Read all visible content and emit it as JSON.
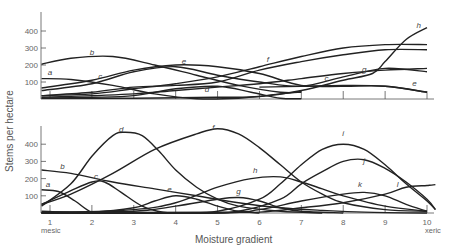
{
  "chart_data": [
    {
      "type": "line",
      "panel": "top",
      "title": "",
      "xlabel": "Moisture gradient",
      "ylabel": "Stems per hectare",
      "xlim": [
        0.8,
        10.3
      ],
      "ylim": [
        0,
        500
      ],
      "yticks": [
        100,
        200,
        300,
        400
      ],
      "xticks": [
        1,
        2,
        3,
        4,
        5,
        6,
        7,
        8,
        9,
        10
      ],
      "xtick_labels_shown": false,
      "series": [
        {
          "name": "a",
          "label_at": [
            1.0,
            140
          ],
          "points": [
            [
              0.8,
              120
            ],
            [
              1.5,
              115
            ],
            [
              2.5,
              80
            ],
            [
              3.5,
              30
            ],
            [
              4.5,
              2
            ],
            [
              5.5,
              5
            ],
            [
              6.5,
              30
            ],
            [
              7.0,
              45
            ]
          ]
        },
        {
          "name": "b",
          "label_at": [
            2.0,
            260
          ],
          "points": [
            [
              0.8,
              205
            ],
            [
              1.5,
              240
            ],
            [
              2.5,
              250
            ],
            [
              3.5,
              200
            ],
            [
              4.5,
              140
            ],
            [
              5.5,
              80
            ],
            [
              6.5,
              40
            ],
            [
              7.0,
              40
            ]
          ]
        },
        {
          "name": "c",
          "label_at": [
            2.2,
            115
          ],
          "points": [
            [
              0.8,
              50
            ],
            [
              2.0,
              90
            ],
            [
              3.0,
              160
            ],
            [
              4.0,
              190
            ],
            [
              5.0,
              140
            ],
            [
              6.0,
              100
            ],
            [
              7.0,
              75
            ],
            [
              8.0,
              130
            ],
            [
              9.0,
              180
            ],
            [
              10.0,
              160
            ]
          ]
        },
        {
          "name": "c",
          "label_at": [
            7.6,
            105
          ],
          "points": [
            [
              0.8,
              20
            ],
            [
              2.0,
              40
            ],
            [
              3.0,
              70
            ],
            [
              4.0,
              80
            ],
            [
              5.0,
              100
            ],
            [
              6.0,
              170
            ],
            [
              7.0,
              220
            ],
            [
              8.0,
              260
            ],
            [
              9.0,
              290
            ],
            [
              10.0,
              290
            ]
          ]
        },
        {
          "name": "d",
          "label_at": [
            4.75,
            40
          ],
          "points": [
            [
              0.8,
              5
            ],
            [
              2.0,
              10
            ],
            [
              3.0,
              20
            ],
            [
              4.0,
              60
            ],
            [
              5.0,
              75
            ],
            [
              5.8,
              40
            ],
            [
              6.5,
              5
            ],
            [
              7.0,
              2
            ]
          ]
        },
        {
          "name": "e",
          "label_at": [
            4.2,
            205
          ],
          "points": [
            [
              0.8,
              65
            ],
            [
              2.0,
              110
            ],
            [
              3.0,
              170
            ],
            [
              4.0,
              200
            ],
            [
              5.0,
              190
            ],
            [
              6.0,
              150
            ],
            [
              7.0,
              80
            ],
            [
              8.0,
              75
            ],
            [
              9.0,
              75
            ],
            [
              10.0,
              40
            ]
          ]
        },
        {
          "name": "e",
          "label_at": [
            9.7,
            75
          ],
          "points": [
            [
              6.0,
              70
            ],
            [
              7.0,
              75
            ],
            [
              8.0,
              80
            ],
            [
              9.0,
              75
            ],
            [
              10.0,
              40
            ]
          ]
        },
        {
          "name": "f",
          "label_at": [
            6.2,
            220
          ],
          "points": [
            [
              0.8,
              20
            ],
            [
              2.0,
              30
            ],
            [
              3.0,
              60
            ],
            [
              4.0,
              90
            ],
            [
              5.0,
              130
            ],
            [
              6.0,
              190
            ],
            [
              7.0,
              250
            ],
            [
              8.0,
              300
            ],
            [
              9.0,
              320
            ],
            [
              10.0,
              320
            ]
          ]
        },
        {
          "name": "g",
          "label_at": [
            8.5,
            160
          ],
          "points": [
            [
              0.8,
              10
            ],
            [
              2.0,
              20
            ],
            [
              3.0,
              30
            ],
            [
              4.0,
              50
            ],
            [
              5.0,
              70
            ],
            [
              6.0,
              90
            ],
            [
              7.0,
              120
            ],
            [
              8.0,
              150
            ],
            [
              9.0,
              170
            ],
            [
              10.0,
              180
            ]
          ]
        },
        {
          "name": "h",
          "label_at": [
            9.8,
            420
          ],
          "points": [
            [
              0.8,
              5
            ],
            [
              3.0,
              5
            ],
            [
              5.0,
              10
            ],
            [
              6.0,
              15
            ],
            [
              7.0,
              50
            ],
            [
              8.0,
              110
            ],
            [
              8.7,
              150
            ],
            [
              9.0,
              220
            ],
            [
              9.5,
              350
            ],
            [
              10.0,
              420
            ]
          ]
        }
      ]
    },
    {
      "type": "line",
      "panel": "bottom",
      "title": "",
      "xlabel": "Moisture gradient",
      "ylabel": "Stems per hectare",
      "xlim": [
        0.8,
        10.3
      ],
      "ylim": [
        0,
        500
      ],
      "yticks": [
        100,
        200,
        300,
        400
      ],
      "xticks": [
        1,
        2,
        3,
        4,
        5,
        6,
        7,
        8,
        9,
        10
      ],
      "xtick_labels": [
        "1",
        "2",
        "3",
        "4",
        "5",
        "6",
        "7",
        "8",
        "9",
        "10"
      ],
      "x_end_labels": {
        "left": "mesic",
        "right": "xeric"
      },
      "series": [
        {
          "name": "a",
          "label_at": [
            0.95,
            150
          ],
          "points": [
            [
              0.8,
              135
            ],
            [
              1.2,
              125
            ],
            [
              1.6,
              70
            ],
            [
              2.0,
              5
            ],
            [
              2.5,
              0
            ]
          ]
        },
        {
          "name": "b",
          "label_at": [
            1.3,
            255
          ],
          "points": [
            [
              0.8,
              250
            ],
            [
              1.5,
              230
            ],
            [
              2.5,
              180
            ],
            [
              3.5,
              140
            ],
            [
              4.5,
              100
            ],
            [
              5.5,
              60
            ],
            [
              6.5,
              30
            ],
            [
              7.5,
              15
            ],
            [
              8.5,
              5
            ],
            [
              10.0,
              0
            ]
          ]
        },
        {
          "name": "c",
          "label_at": [
            2.1,
            200
          ],
          "points": [
            [
              0.8,
              50
            ],
            [
              1.5,
              130
            ],
            [
              2.0,
              180
            ],
            [
              2.3,
              180
            ],
            [
              2.7,
              120
            ],
            [
              3.2,
              40
            ],
            [
              3.7,
              5
            ],
            [
              4.5,
              0
            ]
          ]
        },
        {
          "name": "d",
          "label_at": [
            2.7,
            470
          ],
          "points": [
            [
              0.8,
              40
            ],
            [
              1.5,
              170
            ],
            [
              2.0,
              330
            ],
            [
              2.5,
              450
            ],
            [
              2.8,
              470
            ],
            [
              3.2,
              450
            ],
            [
              3.6,
              360
            ],
            [
              4.0,
              250
            ],
            [
              4.5,
              150
            ],
            [
              5.0,
              80
            ],
            [
              5.5,
              40
            ],
            [
              6.5,
              10
            ],
            [
              7.5,
              0
            ]
          ]
        },
        {
          "name": "e",
          "label_at": [
            3.85,
            120
          ],
          "points": [
            [
              0.8,
              10
            ],
            [
              2.0,
              5
            ],
            [
              3.0,
              30
            ],
            [
              3.5,
              70
            ],
            [
              4.0,
              100
            ],
            [
              4.5,
              80
            ],
            [
              5.0,
              40
            ],
            [
              5.5,
              10
            ],
            [
              6.0,
              0
            ]
          ]
        },
        {
          "name": "f",
          "label_at": [
            4.9,
            480
          ],
          "points": [
            [
              0.8,
              50
            ],
            [
              1.5,
              110
            ],
            [
              2.5,
              230
            ],
            [
              3.5,
              370
            ],
            [
              4.5,
              460
            ],
            [
              5.0,
              490
            ],
            [
              5.5,
              460
            ],
            [
              6.0,
              380
            ],
            [
              6.5,
              280
            ],
            [
              7.0,
              180
            ],
            [
              7.5,
              110
            ],
            [
              8.0,
              60
            ],
            [
              9.0,
              20
            ],
            [
              10.0,
              10
            ]
          ]
        },
        {
          "name": "g",
          "label_at": [
            5.5,
            110
          ],
          "points": [
            [
              0.8,
              5
            ],
            [
              3.0,
              10
            ],
            [
              4.0,
              40
            ],
            [
              5.0,
              80
            ],
            [
              5.5,
              90
            ],
            [
              6.0,
              70
            ],
            [
              6.5,
              30
            ],
            [
              7.0,
              10
            ],
            [
              8.0,
              0
            ]
          ]
        },
        {
          "name": "h",
          "label_at": [
            5.9,
            230
          ],
          "points": [
            [
              0.8,
              0
            ],
            [
              3.0,
              20
            ],
            [
              4.0,
              60
            ],
            [
              5.0,
              150
            ],
            [
              5.8,
              200
            ],
            [
              6.5,
              210
            ],
            [
              7.0,
              180
            ],
            [
              7.5,
              140
            ],
            [
              8.0,
              100
            ],
            [
              9.0,
              40
            ],
            [
              10.0,
              10
            ]
          ]
        },
        {
          "name": "i",
          "label_at": [
            8.0,
            445
          ],
          "points": [
            [
              0.8,
              0
            ],
            [
              4.0,
              0
            ],
            [
              5.0,
              10
            ],
            [
              6.0,
              80
            ],
            [
              6.5,
              170
            ],
            [
              7.0,
              280
            ],
            [
              7.5,
              370
            ],
            [
              8.0,
              400
            ],
            [
              8.5,
              370
            ],
            [
              9.0,
              280
            ],
            [
              9.5,
              170
            ],
            [
              10.0,
              70
            ],
            [
              10.2,
              20
            ]
          ]
        },
        {
          "name": "j",
          "label_at": [
            8.5,
            290
          ],
          "points": [
            [
              0.8,
              0
            ],
            [
              4.5,
              0
            ],
            [
              5.5,
              10
            ],
            [
              6.5,
              80
            ],
            [
              7.0,
              170
            ],
            [
              7.5,
              240
            ],
            [
              8.0,
              300
            ],
            [
              8.5,
              310
            ],
            [
              9.0,
              260
            ],
            [
              9.5,
              180
            ],
            [
              10.0,
              80
            ],
            [
              10.2,
              20
            ]
          ]
        },
        {
          "name": "k",
          "label_at": [
            8.4,
            150
          ],
          "points": [
            [
              0.8,
              0
            ],
            [
              5.0,
              0
            ],
            [
              6.0,
              20
            ],
            [
              7.0,
              70
            ],
            [
              8.0,
              110
            ],
            [
              8.5,
              120
            ],
            [
              9.0,
              100
            ],
            [
              9.5,
              50
            ],
            [
              10.0,
              10
            ]
          ]
        },
        {
          "name": "l",
          "label_at": [
            9.3,
            150
          ],
          "points": [
            [
              0.8,
              0
            ],
            [
              5.0,
              5
            ],
            [
              6.0,
              5
            ],
            [
              7.0,
              30
            ],
            [
              8.0,
              60
            ],
            [
              9.0,
              110
            ],
            [
              9.5,
              150
            ],
            [
              10.0,
              160
            ],
            [
              10.2,
              165
            ]
          ]
        }
      ]
    }
  ],
  "labels": {
    "ylabel": "Stems per hectare",
    "xlabel": "Moisture gradient",
    "mesic": "mesic",
    "xeric": "xeric"
  }
}
